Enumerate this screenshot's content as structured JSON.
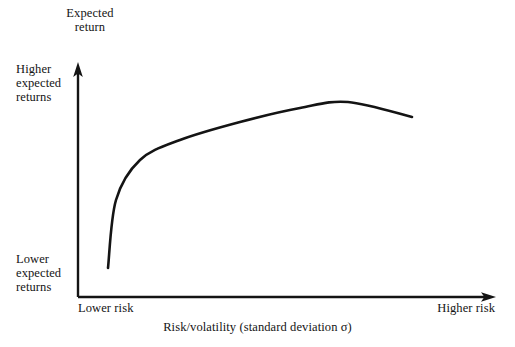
{
  "figure": {
    "background_color": "#ffffff",
    "ink_color": "#141414"
  },
  "axes": {
    "y_axis_title": "Expected\nreturn",
    "x_axis_title": "Risk/volatility (standard deviation σ)",
    "y_label_top": "Higher\nexpected\nreturns",
    "y_label_bottom": "Lower\nexpected\nreturns",
    "x_label_left": "Lower risk",
    "x_label_right": "Higher risk"
  },
  "chart_data": {
    "type": "line",
    "title": "",
    "subtitle": "",
    "xlabel": "Risk/volatility (standard deviation σ)",
    "ylabel": "Expected return",
    "grid": false,
    "legend": "none",
    "axis_style": "arrow-headed L-shaped axes, no tick marks",
    "xlim": [
      0,
      100
    ],
    "ylim": [
      0,
      100
    ],
    "xtick_labels": [
      "Lower risk",
      "Higher risk"
    ],
    "ytick_labels": [
      "Lower expected returns",
      "Higher expected returns"
    ],
    "series": [
      {
        "name": "Efficient frontier",
        "description": "Concave risk-return curve rising steeply then flattening to a maximum before turning slightly downward",
        "x": [
          7,
          10,
          14,
          19,
          25,
          32,
          40,
          48,
          56,
          64,
          72,
          78,
          84,
          90,
          95,
          100
        ],
        "y": [
          12,
          26,
          39,
          50,
          59,
          67,
          74,
          80,
          85,
          89,
          92,
          94,
          95,
          95,
          94,
          91
        ]
      }
    ],
    "annotations": [],
    "curve_pixel_path": {
      "start": [
        108,
        268
      ],
      "control_points": [
        [
          116,
          200
        ],
        [
          140,
          160
        ],
        [
          180,
          140
        ],
        [
          240,
          122
        ],
        [
          300,
          108
        ],
        [
          348,
          102
        ]
      ],
      "peak": [
        348,
        102
      ],
      "end": [
        412,
        117
      ]
    }
  }
}
